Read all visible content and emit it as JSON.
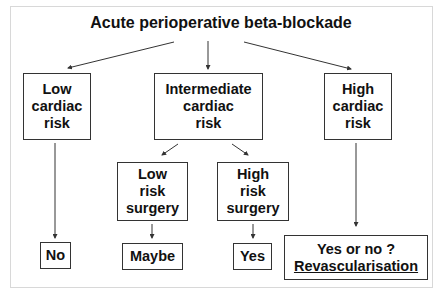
{
  "title": "Acute perioperative beta-blockade",
  "nodes": {
    "low_cardiac": [
      "Low",
      "cardiac",
      "risk"
    ],
    "intermediate_cardiac": [
      "Intermediate",
      "cardiac",
      "risk"
    ],
    "high_cardiac": [
      "High",
      "cardiac",
      "risk"
    ],
    "low_risk_surgery": [
      "Low",
      "risk",
      "surgery"
    ],
    "high_risk_surgery": [
      "High",
      "risk",
      "surgery"
    ],
    "no": "No",
    "maybe": "Maybe",
    "yes": "Yes",
    "yes_or_no": "Yes or no ?",
    "revascularisation": "Revascularisation"
  },
  "colors": {
    "border": "#333333",
    "text": "#111111",
    "frame": "#d8d8d8"
  }
}
